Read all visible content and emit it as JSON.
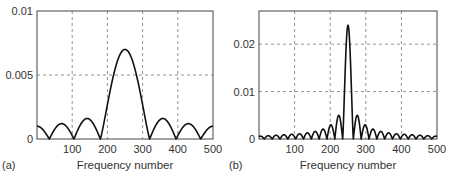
{
  "chart_data": [
    {
      "panel_label": "(a)",
      "type": "line",
      "title": "",
      "xlabel": "Frequency number",
      "ylabel": "",
      "xlim": [
        0,
        500
      ],
      "ylim": [
        0,
        0.01
      ],
      "xticks": [
        100,
        200,
        300,
        400,
        500
      ],
      "xtick_labels": [
        "100",
        "200",
        "300",
        "400",
        "500"
      ],
      "yticks": [
        0,
        0.005,
        0.01
      ],
      "ytick_labels": [
        "0",
        "0.005",
        "0.01"
      ],
      "grid": true,
      "grid_style": "dashed",
      "x": [
        0,
        15,
        35,
        50,
        70,
        90,
        105,
        125,
        145,
        165,
        180,
        200,
        215,
        230,
        250,
        270,
        285,
        300,
        320,
        335,
        355,
        375,
        395,
        410,
        430,
        450,
        465,
        485,
        500
      ],
      "values": [
        0.001,
        0.0008,
        0.0,
        0.0008,
        0.0012,
        0.0008,
        0.0,
        0.0011,
        0.0016,
        0.0011,
        0.0,
        0.0035,
        0.0055,
        0.0066,
        0.007,
        0.0066,
        0.0055,
        0.0035,
        0.0,
        0.0011,
        0.0016,
        0.0011,
        0.0,
        0.0008,
        0.0012,
        0.0008,
        0.0,
        0.0008,
        0.001
      ],
      "main_lobe": {
        "peak_x": 250,
        "peak_y": 0.007,
        "null_left": 180,
        "null_right": 320
      },
      "legend": null
    },
    {
      "panel_label": "(b)",
      "type": "line",
      "title": "",
      "xlabel": "Frequency number",
      "ylabel": "",
      "xlim": [
        0,
        500
      ],
      "ylim": [
        0,
        0.027
      ],
      "xticks": [
        100,
        200,
        300,
        400,
        500
      ],
      "xtick_labels": [
        "100",
        "200",
        "300",
        "400",
        "500"
      ],
      "yticks": [
        0,
        0.01,
        0.02
      ],
      "ytick_labels": [
        "0",
        "0.01",
        "0.02"
      ],
      "grid": true,
      "grid_style": "dashed",
      "main_lobe": {
        "peak_x": 250,
        "peak_y": 0.024,
        "null_left": 235,
        "null_right": 265
      },
      "sidelobes": {
        "period": 22,
        "right_side_x": [
          278,
          300,
          322,
          344,
          366,
          388,
          410,
          432,
          454,
          476,
          495
        ],
        "right_side_peaks": [
          0.005,
          0.003,
          0.0021,
          0.0016,
          0.0013,
          0.0011,
          0.001,
          0.0009,
          0.0008,
          0.0007,
          0.0006
        ],
        "left_side_x": [
          222,
          200,
          178,
          156,
          134,
          112,
          90,
          68,
          46,
          24,
          5
        ],
        "left_side_peaks": [
          0.005,
          0.003,
          0.0021,
          0.0016,
          0.0013,
          0.0011,
          0.001,
          0.0009,
          0.0008,
          0.0007,
          0.0006
        ]
      },
      "legend": null
    }
  ]
}
